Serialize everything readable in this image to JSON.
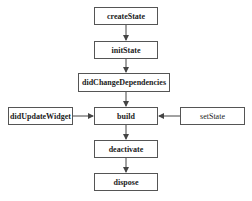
{
  "diagram": {
    "title": "",
    "nodes": {
      "createState": "createState",
      "initState": "initState",
      "didChangeDependencies": "didChangeDependencies",
      "build": "build",
      "didUpdateWidget": "didUpdateWidget",
      "setState": "setState",
      "deactivate": "deactivate",
      "dispose": "dispose"
    },
    "edges": [
      {
        "from": "createState",
        "to": "initState"
      },
      {
        "from": "initState",
        "to": "didChangeDependencies"
      },
      {
        "from": "didChangeDependencies",
        "to": "build"
      },
      {
        "from": "didUpdateWidget",
        "to": "build"
      },
      {
        "from": "setState",
        "to": "build"
      },
      {
        "from": "build",
        "to": "deactivate"
      },
      {
        "from": "deactivate",
        "to": "dispose"
      }
    ],
    "colors": {
      "border": "#555555",
      "text": "#222222",
      "arrow": "#444444",
      "background": "#ffffff"
    }
  }
}
